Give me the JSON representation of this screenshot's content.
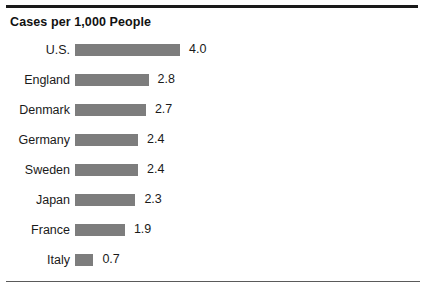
{
  "chart_data": {
    "type": "bar",
    "orientation": "horizontal",
    "title": "Cases per 1,000 People",
    "subtitle": "",
    "xlabel": "",
    "ylabel": "",
    "grid": false,
    "legend": null,
    "xlim": [
      0,
      4.0
    ],
    "categories": [
      "U.S.",
      "England",
      "Denmark",
      "Germany",
      "Sweden",
      "Japan",
      "France",
      "Italy"
    ],
    "values": [
      4.0,
      2.8,
      2.7,
      2.4,
      2.4,
      2.3,
      1.9,
      0.7
    ],
    "value_labels": [
      "4.0",
      "2.8",
      "2.7",
      "2.4",
      "2.4",
      "2.3",
      "1.9",
      "0.7"
    ],
    "bars": [
      {
        "label": "U.S.",
        "value": 4.0,
        "value_label": "4.0"
      },
      {
        "label": "England",
        "value": 2.8,
        "value_label": "2.8"
      },
      {
        "label": "Denmark",
        "value": 2.7,
        "value_label": "2.7"
      },
      {
        "label": "Germany",
        "value": 2.4,
        "value_label": "2.4"
      },
      {
        "label": "Sweden",
        "value": 2.4,
        "value_label": "2.4"
      },
      {
        "label": "Japan",
        "value": 2.3,
        "value_label": "2.3"
      },
      {
        "label": "France",
        "value": 1.9,
        "value_label": "1.9"
      },
      {
        "label": "Italy",
        "value": 0.7,
        "value_label": "0.7"
      }
    ],
    "colors": {
      "bar_fill": "#7d7d7d",
      "text": "#1a1a1a",
      "rule": "#1a1a1a",
      "background": "#ffffff"
    }
  }
}
